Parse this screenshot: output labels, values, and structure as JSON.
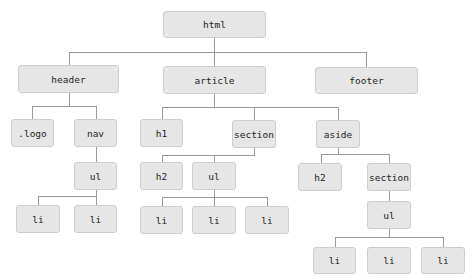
{
  "diagram": {
    "colors": {
      "node_fill": "#e6e6e6",
      "node_border": "#cdcdcd",
      "connector": "#9a9a9a",
      "text": "#222222"
    },
    "nodes": {
      "html": "html",
      "header": "header",
      "article": "article",
      "footer": "footer",
      "logo": ".logo",
      "nav": "nav",
      "nav_ul": "ul",
      "nav_li_1": "li",
      "nav_li_2": "li",
      "h1": "h1",
      "section": "section",
      "section_h2": "h2",
      "section_ul": "ul",
      "section_li_1": "li",
      "section_li_2": "li",
      "section_li_3": "li",
      "aside": "aside",
      "aside_h2": "h2",
      "aside_section": "section",
      "aside_ul": "ul",
      "aside_li_1": "li",
      "aside_li_2": "li",
      "aside_li_3": "li"
    },
    "edges": [
      [
        "html",
        "header"
      ],
      [
        "html",
        "article"
      ],
      [
        "html",
        "footer"
      ],
      [
        "header",
        "logo"
      ],
      [
        "header",
        "nav"
      ],
      [
        "nav",
        "nav_ul"
      ],
      [
        "nav_ul",
        "nav_li_1"
      ],
      [
        "nav_ul",
        "nav_li_2"
      ],
      [
        "article",
        "h1"
      ],
      [
        "article",
        "section"
      ],
      [
        "article",
        "aside"
      ],
      [
        "section",
        "section_h2"
      ],
      [
        "section",
        "section_ul"
      ],
      [
        "section_ul",
        "section_li_1"
      ],
      [
        "section_ul",
        "section_li_2"
      ],
      [
        "section_ul",
        "section_li_3"
      ],
      [
        "aside",
        "aside_h2"
      ],
      [
        "aside",
        "aside_section"
      ],
      [
        "aside_section",
        "aside_ul"
      ],
      [
        "aside_ul",
        "aside_li_1"
      ],
      [
        "aside_ul",
        "aside_li_2"
      ],
      [
        "aside_ul",
        "aside_li_3"
      ]
    ]
  }
}
